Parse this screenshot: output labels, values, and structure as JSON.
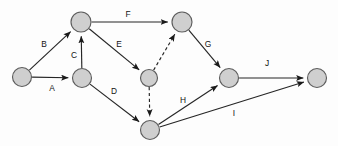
{
  "diagram": {
    "background_color": "#fdfdfd",
    "node_fill": "#cfcfcf",
    "node_stroke": "#5d5d5d",
    "edge_color": "#262626",
    "label_color": "#131313",
    "nodes": [
      {
        "id": "n1",
        "label": "",
        "x": 22,
        "y": 77,
        "r": 9.5
      },
      {
        "id": "n2",
        "label": "",
        "x": 81,
        "y": 22,
        "r": 10.0
      },
      {
        "id": "n3",
        "label": "",
        "x": 82,
        "y": 78,
        "r": 9.5
      },
      {
        "id": "n4",
        "label": "",
        "x": 182,
        "y": 22,
        "r": 10.0
      },
      {
        "id": "n5",
        "label": "",
        "x": 149,
        "y": 78,
        "r": 8.5
      },
      {
        "id": "n6",
        "label": "",
        "x": 229,
        "y": 78,
        "r": 9.5
      },
      {
        "id": "n7",
        "label": "",
        "x": 150,
        "y": 130,
        "r": 9.5
      },
      {
        "id": "n8",
        "label": "",
        "x": 317,
        "y": 78,
        "r": 9.5
      }
    ],
    "edges": [
      {
        "id": "e_A",
        "label": "A",
        "from": "n1",
        "to": "n3",
        "style": "solid",
        "label_x": 52,
        "label_y": 89
      },
      {
        "id": "e_B",
        "label": "B",
        "from": "n1",
        "to": "n2",
        "style": "solid",
        "label_x": 44,
        "label_y": 45
      },
      {
        "id": "e_C",
        "label": "C",
        "from": "n3",
        "to": "n2",
        "style": "solid",
        "label_x": 74,
        "label_y": 56
      },
      {
        "id": "e_D",
        "label": "D",
        "from": "n3",
        "to": "n7",
        "style": "solid",
        "label_x": 114,
        "label_y": 92
      },
      {
        "id": "e_E",
        "label": "E",
        "from": "n2",
        "to": "n5",
        "style": "solid",
        "label_x": 119,
        "label_y": 45
      },
      {
        "id": "e_F",
        "label": "F",
        "from": "n2",
        "to": "n4",
        "style": "solid",
        "label_x": 128,
        "label_y": 15
      },
      {
        "id": "e_G",
        "label": "G",
        "from": "n4",
        "to": "n6",
        "style": "solid",
        "label_x": 208,
        "label_y": 45
      },
      {
        "id": "e_H",
        "label": "H",
        "from": "n7",
        "to": "n6",
        "style": "solid",
        "label_x": 183,
        "label_y": 101
      },
      {
        "id": "e_I",
        "label": "I",
        "from": "n7",
        "to": "n8",
        "style": "solid",
        "label_x": 234,
        "label_y": 114
      },
      {
        "id": "e_J",
        "label": "J",
        "from": "n6",
        "to": "n8",
        "style": "solid",
        "label_x": 267,
        "label_y": 64
      },
      {
        "id": "e_dash1",
        "label": "",
        "from": "n5",
        "to": "n4",
        "style": "dashed",
        "label_x": 0,
        "label_y": 0
      },
      {
        "id": "e_dash2",
        "label": "",
        "from": "n5",
        "to": "n7",
        "style": "dashed",
        "label_x": 0,
        "label_y": 0
      }
    ]
  }
}
